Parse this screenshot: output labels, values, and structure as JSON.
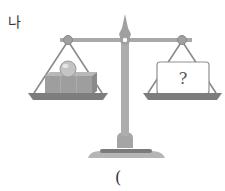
{
  "problem": {
    "label": "나",
    "answer_paren": "(",
    "unknown_mark": "?"
  },
  "scale": {
    "left_pan_contents": [
      "sphere",
      "cube",
      "cube",
      "cube"
    ],
    "right_pan_contents": [
      "unknown-box"
    ],
    "colors": {
      "frame": "#a9a9a9",
      "frame_dark": "#8a8a8a",
      "pan": "#7d7d7d",
      "cube": "#9b9b9b",
      "sphere": "#c8c8c8",
      "box_fill": "#ffffff",
      "box_stroke": "#8f8f8f"
    }
  }
}
